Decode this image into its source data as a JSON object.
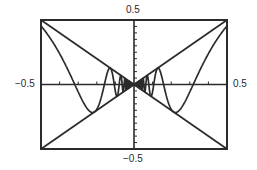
{
  "chart_data": {
    "type": "line",
    "title": "",
    "xlabel": "",
    "ylabel": "",
    "xlim": [
      -0.5,
      0.5
    ],
    "ylim": [
      -0.5,
      0.5
    ],
    "grid": false,
    "legend": null,
    "axis_labels": {
      "top": "0.5",
      "bottom": "-0.5",
      "left": "-0.5",
      "right": "0.5"
    },
    "tick_step": 0.1,
    "series": [
      {
        "name": "y = x",
        "function": "x",
        "x": [
          -0.5,
          0.5
        ],
        "y": [
          -0.5,
          0.5
        ]
      },
      {
        "name": "y = -x",
        "function": "-x",
        "x": [
          -0.5,
          0.5
        ],
        "y": [
          0.5,
          -0.5
        ]
      },
      {
        "name": "y = x sin(1/x)",
        "function": "x*sin(1/x)",
        "x": [
          -0.5,
          -0.4,
          -0.3183,
          -0.25,
          -0.2122,
          -0.1592,
          -0.1273,
          -0.1061,
          -0.0909,
          0,
          0.0909,
          0.1061,
          0.1273,
          0.1592,
          0.2122,
          0.25,
          0.3183,
          0.4,
          0.5
        ],
        "y": [
          0.4546,
          0.2394,
          0.0,
          -0.1892,
          -0.2122,
          0.0,
          0.1273,
          0.0,
          -0.0909,
          0,
          -0.0909,
          0.0,
          0.1273,
          0.0,
          -0.2122,
          -0.1892,
          0.0,
          0.2394,
          0.4546
        ]
      }
    ]
  },
  "labels": {
    "top": "0.5",
    "bottom": "−0.5",
    "left": "−0.5",
    "right": "0.5"
  },
  "colors": {
    "line": "#2b2b2b",
    "background": "#ffffff"
  }
}
